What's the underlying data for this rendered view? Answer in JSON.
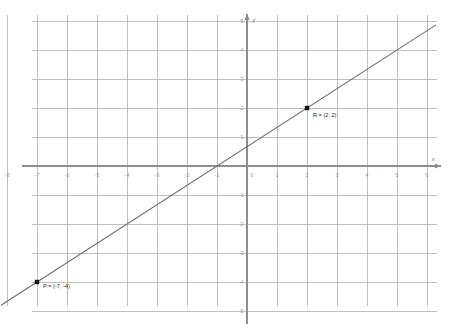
{
  "chart_data": {
    "type": "line",
    "title": "",
    "xlabel": "x",
    "ylabel": "y",
    "xlim": [
      -8.5,
      6.7
    ],
    "ylim": [
      -5.6,
      5.6
    ],
    "grid": true,
    "legend": "none",
    "x_ticks": [
      "-8",
      "-7",
      "-6",
      "-5",
      "-4",
      "-3",
      "-2",
      "-1",
      "0",
      "1",
      "2",
      "3",
      "4",
      "5",
      "6"
    ],
    "x_tick_values": [
      -8,
      -7,
      -6,
      -5,
      -4,
      -3,
      -2,
      -1,
      0,
      1,
      2,
      3,
      4,
      5,
      6
    ],
    "y_ticks": [
      "5",
      "4",
      "3",
      "2",
      "1",
      "-1",
      "-2",
      "-3",
      "-4",
      "-5"
    ],
    "y_tick_values": [
      5,
      4,
      3,
      2,
      1,
      -1,
      -2,
      -3,
      -4,
      -5
    ],
    "series": [
      {
        "name": "line-PR",
        "x": [
          -7,
          2
        ],
        "values": [
          -4,
          2
        ],
        "slope": 0.6666666667,
        "intercept": 0.6666666667,
        "x_extent": [
          -8.2,
          6.3
        ],
        "y_extent": [
          -4.8,
          4.65
        ]
      }
    ],
    "points": [
      {
        "id": "P",
        "label": "P = (-7, -4)",
        "x": -7,
        "y": -4,
        "label_dx": 6,
        "label_dy": 6
      },
      {
        "id": "R",
        "label": "R = (2, 2)",
        "x": 2,
        "y": 2,
        "label_dx": 6,
        "label_dy": 9
      }
    ],
    "colors": {
      "background": "#ffffff",
      "grid": "#b9b9bb",
      "axis": "#8d8d92",
      "line": "#6b6b70",
      "point": "#141414",
      "tick_text": "#9a9a9e",
      "point_label": "#1d1d1d"
    }
  }
}
